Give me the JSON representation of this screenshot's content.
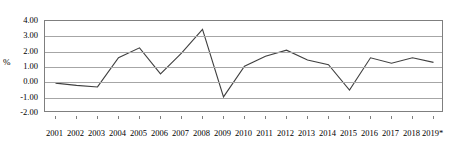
{
  "chart_data": {
    "type": "line",
    "title": "",
    "subtitle": "",
    "xlabel": "",
    "ylabel": "%",
    "categories": [
      "2001",
      "2002",
      "2003",
      "2004",
      "2005",
      "2006",
      "2007",
      "2008",
      "2009",
      "2010",
      "2011",
      "2012",
      "2013",
      "2014",
      "2015",
      "2016",
      "2017",
      "2018",
      "2019*"
    ],
    "values": [
      -0.05,
      -0.2,
      -0.3,
      1.6,
      2.25,
      0.55,
      1.9,
      3.45,
      -0.95,
      1.05,
      1.7,
      2.1,
      1.45,
      1.15,
      -0.5,
      1.6,
      1.25,
      1.6,
      1.3
    ],
    "series": [
      {
        "name": "",
        "values": [
          -0.05,
          -0.2,
          -0.3,
          1.6,
          2.25,
          0.55,
          1.9,
          3.45,
          -0.95,
          1.05,
          1.7,
          2.1,
          1.45,
          1.15,
          -0.5,
          1.6,
          1.25,
          1.6,
          1.3
        ]
      }
    ],
    "ylim": [
      -2.0,
      4.0
    ],
    "yticks": [
      4.0,
      3.0,
      2.0,
      1.0,
      0.0,
      -1.0,
      -2.0
    ],
    "ytick_labels": [
      "4.00",
      "3.00",
      "2.00",
      "1.00",
      "0.00",
      "-1.00",
      "-2.00"
    ],
    "grid": true,
    "legend": "none",
    "footnote": "*",
    "colors": {
      "line": "#404040",
      "grid": "#a6a6a6",
      "frame": "#7f7f7f",
      "background": "#ffffff",
      "text": "#000000"
    }
  }
}
